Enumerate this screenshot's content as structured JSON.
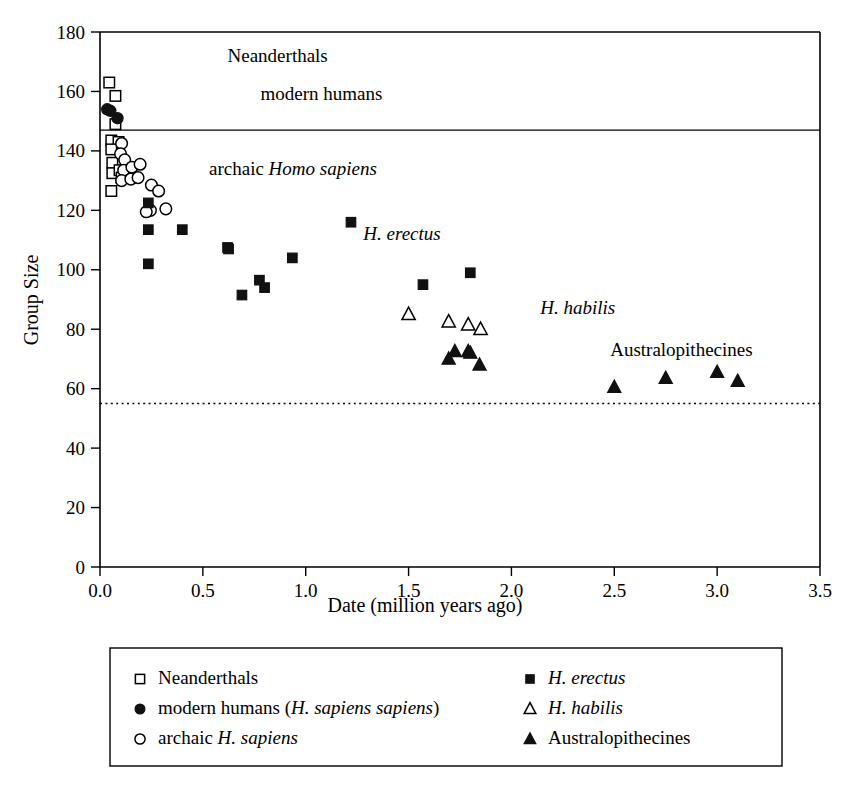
{
  "chart_data": {
    "type": "scatter",
    "title": "",
    "xlabel": "Date (million years ago)",
    "ylabel": "Group Size",
    "xlim": [
      0.0,
      3.5
    ],
    "ylim": [
      0,
      180
    ],
    "xticks": [
      "0.0",
      "0.5",
      "1.0",
      "1.5",
      "2.0",
      "2.5",
      "3.0",
      "3.5"
    ],
    "xtick_values": [
      0.0,
      0.5,
      1.0,
      1.5,
      2.0,
      2.5,
      3.0,
      3.5
    ],
    "yticks": [
      "0",
      "20",
      "40",
      "60",
      "80",
      "100",
      "120",
      "140",
      "160",
      "180"
    ],
    "ytick_values": [
      0,
      20,
      40,
      60,
      80,
      100,
      120,
      140,
      160,
      180
    ],
    "grid": false,
    "legend_position": "below-plot",
    "reference_lines": [
      {
        "name": "modern-human-group-size-line",
        "orientation": "horizontal",
        "y": 147,
        "style": "solid"
      },
      {
        "name": "lower-reference-line",
        "orientation": "horizontal",
        "y": 55,
        "style": "dotted"
      }
    ],
    "plot_annotations": [
      {
        "name": "annotation-neanderthals",
        "text": "Neanderthals",
        "x": 0.62,
        "y": 170,
        "italic": false
      },
      {
        "name": "annotation-modern-humans",
        "text": "modern humans",
        "x": 0.78,
        "y": 157,
        "italic": false
      },
      {
        "name": "annotation-archaic-homo-sapiens",
        "text": "archaic ",
        "text_italic": "Homo sapiens",
        "x": 0.53,
        "y": 132,
        "italic": false
      },
      {
        "name": "annotation-h-erectus",
        "text": "",
        "text_italic": "H. erectus",
        "x": 1.28,
        "y": 110,
        "italic": true
      },
      {
        "name": "annotation-h-habilis",
        "text": "",
        "text_italic": "H. habilis",
        "x": 2.14,
        "y": 85,
        "italic": true
      },
      {
        "name": "annotation-australopithecines",
        "text": "Australopithecines",
        "x": 2.48,
        "y": 71,
        "italic": false
      }
    ],
    "series": [
      {
        "name": "Neanderthals",
        "marker": "open-square",
        "points": [
          [
            0.045,
            163
          ],
          [
            0.075,
            158.5
          ],
          [
            0.075,
            149
          ],
          [
            0.055,
            143.5
          ],
          [
            0.09,
            143
          ],
          [
            0.055,
            140.5
          ],
          [
            0.06,
            136
          ],
          [
            0.06,
            132.5
          ],
          [
            0.095,
            133.5
          ],
          [
            0.105,
            131
          ],
          [
            0.055,
            126.5
          ]
        ]
      },
      {
        "name": "modern humans (H. sapiens sapiens)",
        "marker": "filled-circle",
        "points": [
          [
            0.035,
            154
          ],
          [
            0.05,
            153.5
          ],
          [
            0.085,
            151
          ]
        ]
      },
      {
        "name": "archaic H. sapiens",
        "marker": "open-circle",
        "points": [
          [
            0.105,
            142.5
          ],
          [
            0.1,
            139
          ],
          [
            0.12,
            137
          ],
          [
            0.115,
            133.5
          ],
          [
            0.105,
            130
          ],
          [
            0.155,
            134.5
          ],
          [
            0.15,
            130.5
          ],
          [
            0.195,
            135.5
          ],
          [
            0.185,
            131
          ],
          [
            0.25,
            128.5
          ],
          [
            0.285,
            126.5
          ],
          [
            0.245,
            120
          ],
          [
            0.225,
            119.5
          ],
          [
            0.32,
            120.5
          ]
        ]
      },
      {
        "name": "H. erectus",
        "marker": "filled-square",
        "points": [
          [
            0.235,
            122.5
          ],
          [
            0.235,
            113.5
          ],
          [
            0.235,
            102
          ],
          [
            0.4,
            113.5
          ],
          [
            0.62,
            107.5
          ],
          [
            0.625,
            107
          ],
          [
            0.69,
            91.5
          ],
          [
            0.775,
            96.5
          ],
          [
            0.8,
            94
          ],
          [
            0.935,
            104
          ],
          [
            1.22,
            116
          ],
          [
            1.57,
            95
          ],
          [
            1.8,
            99
          ]
        ]
      },
      {
        "name": "H. habilis",
        "marker": "open-triangle",
        "points": [
          [
            1.5,
            85
          ],
          [
            1.695,
            82.5
          ],
          [
            1.79,
            81.5
          ],
          [
            1.85,
            80
          ]
        ]
      },
      {
        "name": "Australopithecines",
        "marker": "filled-triangle",
        "points": [
          [
            1.695,
            70
          ],
          [
            1.725,
            72.5
          ],
          [
            1.79,
            72.5
          ],
          [
            1.8,
            72
          ],
          [
            1.845,
            68
          ],
          [
            2.5,
            60.5
          ],
          [
            2.75,
            63.5
          ],
          [
            3.0,
            65.5
          ],
          [
            3.1,
            62.5
          ]
        ]
      }
    ]
  },
  "legend": {
    "entries_left": [
      {
        "name": "legend-neanderthals",
        "marker": "open-square",
        "text": "Neanderthals",
        "italic_part": ""
      },
      {
        "name": "legend-modern-humans",
        "marker": "filled-circle",
        "text": "modern humans (",
        "italic_part": "H. sapiens sapiens",
        "text_tail": ")"
      },
      {
        "name": "legend-archaic-h-sapiens",
        "marker": "open-circle",
        "text": "archaic ",
        "italic_part": "H. sapiens",
        "text_tail": ""
      }
    ],
    "entries_right": [
      {
        "name": "legend-h-erectus",
        "marker": "filled-square",
        "text": "",
        "italic_part": "H. erectus",
        "text_tail": ""
      },
      {
        "name": "legend-h-habilis",
        "marker": "open-triangle",
        "text": "",
        "italic_part": "H. habilis",
        "text_tail": ""
      },
      {
        "name": "legend-australopithecines",
        "marker": "filled-triangle",
        "text": "Australopithecines",
        "italic_part": "",
        "text_tail": ""
      }
    ]
  },
  "colors": {
    "foreground": "#000000",
    "background": "#ffffff",
    "marker_fill": "#111111",
    "marker_open": "#ffffff"
  }
}
